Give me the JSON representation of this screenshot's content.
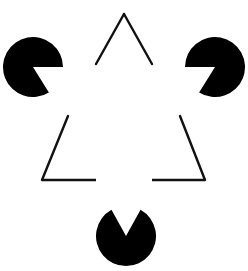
{
  "figure": {
    "name": "kanizsa-triangle",
    "caption": "contour illusion.",
    "caption_clipped": true,
    "background_color": "#ffffff",
    "ink_color": "#000000",
    "canvas": {
      "width": 248,
      "height": 271
    }
  },
  "illusory_triangle": {
    "label": "illusory-triangle",
    "description": "Upward-pointing triangle perceived from the three wedge notches; no contour is drawn.",
    "vertices": [
      {
        "x": 124,
        "y": 67
      },
      {
        "x": 33,
        "y": 225
      },
      {
        "x": 215,
        "y": 225
      }
    ]
  },
  "outlined_triangle": {
    "label": "outlined-triangle",
    "description": "Upward-pointing stroked triangle whose three corners are occluded by the black discs.",
    "stroke_color": "#111111",
    "stroke_width": 2.4,
    "apex": {
      "x": 124,
      "y": 14
    },
    "bottom_left": {
      "x": 42,
      "y": 180
    },
    "bottom_right": {
      "x": 205,
      "y": 180
    },
    "segments": [
      {
        "name": "left-edge-upper",
        "x1": 124,
        "y1": 14,
        "x2": 96,
        "y2": 64
      },
      {
        "name": "left-edge-lower",
        "x1": 68,
        "y1": 116,
        "x2": 42,
        "y2": 180
      },
      {
        "name": "right-edge-upper",
        "x1": 124,
        "y1": 14,
        "x2": 152,
        "y2": 64
      },
      {
        "name": "right-edge-lower",
        "x1": 180,
        "y1": 116,
        "x2": 205,
        "y2": 180
      },
      {
        "name": "bottom-edge-left",
        "x1": 42,
        "y1": 180,
        "x2": 96,
        "y2": 180
      },
      {
        "name": "bottom-edge-right",
        "x1": 152,
        "y1": 180,
        "x2": 205,
        "y2": 180
      }
    ]
  },
  "discs": [
    {
      "label": "pacman-top-left",
      "fill": "#000000",
      "center": {
        "x": 33,
        "y": 67
      },
      "radius": 30,
      "wedge_opening_deg": 58,
      "wedge_direction": "right",
      "wedge_start_deg": 0,
      "wedge_end_deg": 58
    },
    {
      "label": "pacman-top-right",
      "fill": "#000000",
      "center": {
        "x": 215,
        "y": 67
      },
      "radius": 30,
      "wedge_opening_deg": 58,
      "wedge_direction": "left",
      "wedge_start_deg": 122,
      "wedge_end_deg": 180
    },
    {
      "label": "pacman-bottom-center",
      "fill": "#000000",
      "center": {
        "x": 126,
        "y": 236
      },
      "radius": 30,
      "wedge_opening_deg": 58,
      "wedge_direction": "up",
      "wedge_start_deg": 241,
      "wedge_end_deg": 299
    }
  ]
}
